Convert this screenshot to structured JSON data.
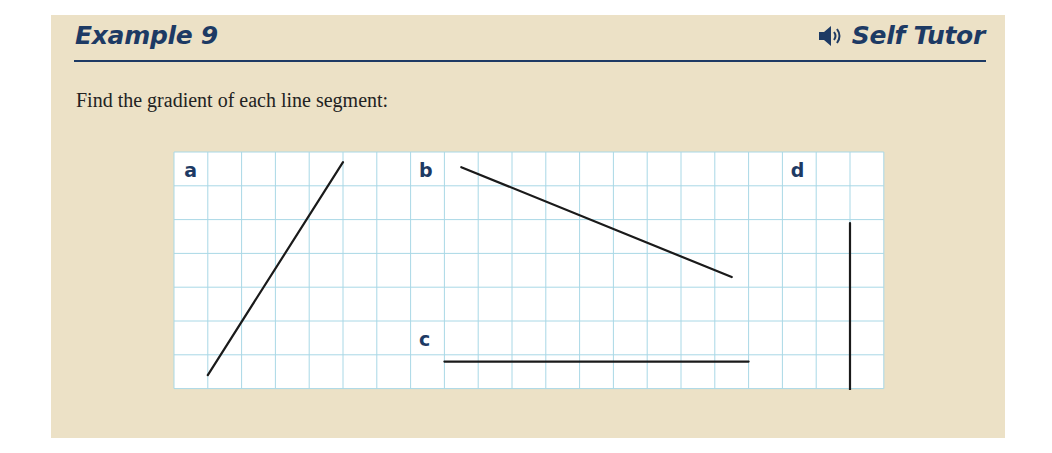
{
  "header": {
    "title": "Example 9",
    "self_tutor_label": "Self Tutor",
    "self_tutor_icon": "speaker-icon"
  },
  "prompt": "Find the gradient of each line segment:",
  "colors": {
    "panel_bg": "#ece1c6",
    "heading": "#1d3a64",
    "grid_line": "#a9d8e6",
    "segment": "#1a1a1a"
  },
  "grid": {
    "columns": 21,
    "rows": 7,
    "cell_px": 33.8
  },
  "segments": [
    {
      "label": "a",
      "label_pos": [
        0.3,
        0.75
      ],
      "from": [
        1,
        6.6
      ],
      "to": [
        5,
        0.3
      ]
    },
    {
      "label": "b",
      "label_pos": [
        7.25,
        0.75
      ],
      "from": [
        8.5,
        0.45
      ],
      "to": [
        16.5,
        3.7
      ]
    },
    {
      "label": "c",
      "label_pos": [
        7.25,
        5.75
      ],
      "from": [
        8,
        6.2
      ],
      "to": [
        17,
        6.2
      ]
    },
    {
      "label": "d",
      "label_pos": [
        18.25,
        0.75
      ],
      "from": [
        20,
        2.1
      ],
      "to": [
        20,
        7.1
      ]
    }
  ]
}
